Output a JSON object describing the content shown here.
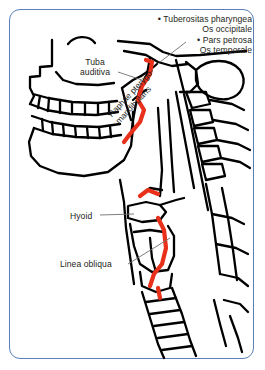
{
  "figure": {
    "border_color": "#5b7fb4",
    "ink_color": "#000000",
    "highlight_color": "#e8301a"
  },
  "labels": {
    "top_right": {
      "line1_bullet": "•",
      "line1": "Tuberositas pharyngea",
      "line2": "Os occipitale",
      "line3_bullet": "•",
      "line3": "Pars petrosa",
      "line4": "Os temporale"
    },
    "tuba": {
      "line1": "Tuba",
      "line2": "auditiva"
    },
    "raphe": {
      "line1": "Raphae pterygo-",
      "line2": "mandibularis"
    },
    "hyoid": "Hyoid",
    "linea_obliqua": "Linea obliqua"
  }
}
